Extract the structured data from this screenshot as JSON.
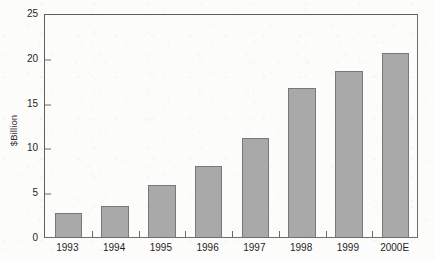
{
  "chart_data": {
    "type": "bar",
    "title": "",
    "xlabel": "",
    "ylabel": "$Billion",
    "categories": [
      "1993",
      "1994",
      "1995",
      "1996",
      "1997",
      "1998",
      "1999",
      "2000E"
    ],
    "values": [
      2.7,
      3.5,
      5.75,
      7.9,
      11.1,
      16.6,
      18.5,
      20.5
    ],
    "ylim": [
      0,
      25
    ],
    "yticks": [
      0,
      5,
      10,
      15,
      20,
      25
    ],
    "ytick_labels": [
      "0",
      "5",
      "10",
      "15",
      "20",
      "25"
    ],
    "grid": false,
    "legend": null,
    "bar_color": "#a9a9a9",
    "bar_edge_color": "#787878",
    "axis_color": "#6e6e6e",
    "text_color": "#1f1f1f",
    "background_color": "#fcfcfa"
  }
}
